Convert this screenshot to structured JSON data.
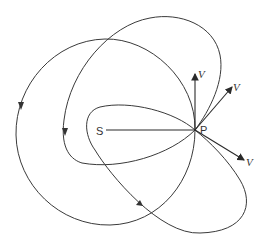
{
  "diagram": {
    "type": "orbit-diagram",
    "labels": {
      "focus": "S",
      "point": "P",
      "velocity_up": "V",
      "velocity_upper_right": "V",
      "velocity_lower_right": "V"
    },
    "colors": {
      "stroke": "#3a3a3a",
      "background": "#ffffff"
    },
    "orbits": [
      {
        "name": "large-orbit",
        "direction": "counterclockwise-arrow-left"
      },
      {
        "name": "upper-orbit",
        "direction": "arrow-left"
      },
      {
        "name": "lower-orbit",
        "direction": "arrow-bottom"
      }
    ]
  }
}
